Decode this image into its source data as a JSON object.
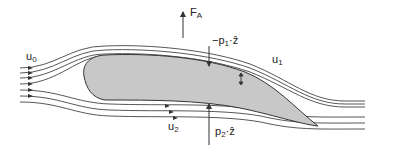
{
  "diagram": {
    "type": "airfoil-streamlines",
    "colors": {
      "airfoil_fill": "#c8c8c8",
      "stroke": "#333333",
      "background": "#ffffff"
    },
    "labels": {
      "u0": {
        "base": "u",
        "sub": "0"
      },
      "u1": {
        "base": "u",
        "sub": "1"
      },
      "u2": {
        "base": "u",
        "sub": "2"
      },
      "lift": {
        "base": "F",
        "sub": "A"
      },
      "p1": {
        "prefix": "−p",
        "sub": "1",
        "suffix": "·ẑ"
      },
      "p2": {
        "prefix": "p",
        "sub": "2",
        "suffix": "·ẑ"
      }
    }
  }
}
